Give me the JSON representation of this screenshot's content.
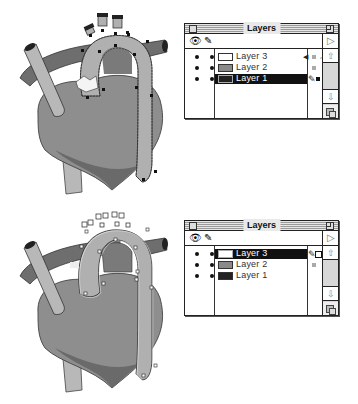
{
  "figures": [
    {
      "id": "top",
      "illustration": {
        "subject": "heart-with-aorta",
        "state": "aorta path selected with black anchor points on Layer 1 (drawn on Layer 3 location)"
      },
      "panel": {
        "title": "Layers",
        "header_icons": [
          "eye-icon",
          "pencil-icon"
        ],
        "menu_arrow": "▷",
        "layers": [
          {
            "name": "Layer 3",
            "swatch": "#ffffff",
            "selected": false,
            "visible": true,
            "locked_col": true,
            "right_marker": "speaker-icon",
            "right_square": "light"
          },
          {
            "name": "Layer 2",
            "swatch": "#8a8a8a",
            "selected": false,
            "visible": true,
            "locked_col": true,
            "right_marker": "",
            "right_square": "light"
          },
          {
            "name": "Layer 1",
            "swatch": "#222222",
            "selected": true,
            "visible": true,
            "locked_col": true,
            "right_marker": "pencil-icon",
            "right_square": "dark"
          }
        ],
        "drag_cursor": "hand-icon",
        "scroll": {
          "up": "⇧",
          "down": "⇩"
        }
      }
    },
    {
      "id": "bottom",
      "illustration": {
        "subject": "heart-with-aorta",
        "state": "aorta path selected with hollow anchor points moved to Layer 3"
      },
      "panel": {
        "title": "Layers",
        "header_icons": [
          "eye-icon",
          "pencil-icon"
        ],
        "menu_arrow": "▷",
        "layers": [
          {
            "name": "Layer 3",
            "swatch": "#ffffff",
            "selected": true,
            "visible": true,
            "locked_col": true,
            "right_marker": "pencil-icon",
            "right_square": "outline"
          },
          {
            "name": "Layer 2",
            "swatch": "#8a8a8a",
            "selected": false,
            "visible": true,
            "locked_col": true,
            "right_marker": "",
            "right_square": "light"
          },
          {
            "name": "Layer 1",
            "swatch": "#222222",
            "selected": false,
            "visible": true,
            "locked_col": true,
            "right_marker": "",
            "right_square": "none"
          }
        ],
        "drag_cursor": "",
        "scroll": {
          "up": "⇧",
          "down": "⇩"
        }
      }
    }
  ],
  "icons": {
    "eye": "👁",
    "pencil": "✎",
    "hand": "☜",
    "speaker": "◀"
  }
}
